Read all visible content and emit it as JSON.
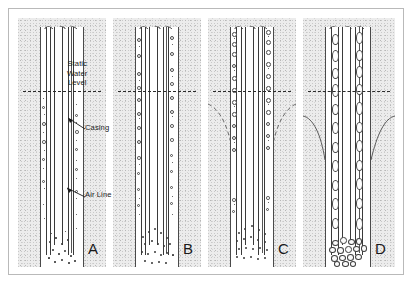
{
  "figure": {
    "background_color": "#ffffff",
    "frame_color": "#b9b9b9",
    "aquifer_fill_color": "#ececec",
    "line_color": "#3a3a3a",
    "water_level_line_color": "#2b2b2b"
  },
  "annotations": {
    "static_water_level": "Static\nWater\nLevel",
    "static_water_level_line1": "Static",
    "static_water_level_line2": "Water",
    "static_water_level_line3": "Level",
    "casing": "Casing",
    "air_line": "Air Line"
  },
  "panels": [
    {
      "letter": "A",
      "description": "Clean well, fine scattered particles in borehole, small sediment pile at bottom",
      "bubble_density": "low",
      "sediment": "fine sand",
      "drawdown_cone": false
    },
    {
      "letter": "B",
      "description": "Increased bubbles along casing walls, larger sediment pile at bottom",
      "bubble_density": "medium",
      "sediment": "sand",
      "drawdown_cone": false
    },
    {
      "letter": "C",
      "description": "Dense bubbles along casing, drawdown cone formed, coarse sediment pile",
      "bubble_density": "high",
      "sediment": "coarse sand",
      "drawdown_cone": true
    },
    {
      "letter": "D",
      "description": "Largest voids along casing, deep drawdown cone, gravel and cobbles at bottom",
      "bubble_density": "very high",
      "sediment": "gravel and cobbles",
      "drawdown_cone": true
    }
  ]
}
